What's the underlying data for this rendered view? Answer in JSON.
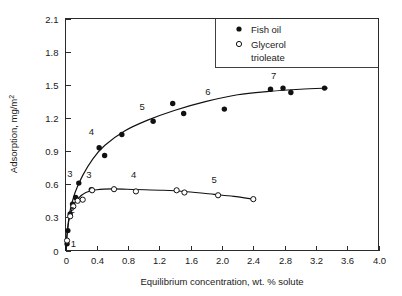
{
  "chart_data": {
    "type": "scatter",
    "title": "",
    "xlabel": "Equilibrium concentration, wt. % solute",
    "ylabel": "Adsorption, mg/m2",
    "ylabel_display": "Adsorption, mg/m",
    "ylabel_exponent": "2",
    "xlim": [
      0,
      4.0
    ],
    "ylim": [
      0,
      2.1
    ],
    "xticks": [
      "0",
      "0.4",
      "0.8",
      "1.2",
      "1.6",
      "2.0",
      "2.4",
      "2.8",
      "3.2",
      "3.6",
      "4.0"
    ],
    "xtick_values": [
      0,
      0.4,
      0.8,
      1.2,
      1.6,
      2.0,
      2.4,
      2.8,
      3.2,
      3.6,
      4.0
    ],
    "yticks": [
      "0",
      "0.3",
      "0.6",
      "0.9",
      "1.2",
      "1.5",
      "1.8",
      "2.1"
    ],
    "ytick_values": [
      0,
      0.3,
      0.6,
      0.9,
      1.2,
      1.5,
      1.8,
      2.1
    ],
    "grid": false,
    "legend_position": "top-right",
    "series": [
      {
        "name": "Fish oil",
        "marker": "filled-circle",
        "color": "#111111",
        "points": [
          {
            "x": 0.02,
            "y": 0.06
          },
          {
            "x": 0.03,
            "y": 0.18
          },
          {
            "x": 0.06,
            "y": 0.33
          },
          {
            "x": 0.09,
            "y": 0.42
          },
          {
            "x": 0.13,
            "y": 0.48
          },
          {
            "x": 0.17,
            "y": 0.61
          },
          {
            "x": 0.33,
            "y": 0.55
          },
          {
            "x": 0.43,
            "y": 0.93
          },
          {
            "x": 0.5,
            "y": 0.86
          },
          {
            "x": 0.72,
            "y": 1.05
          },
          {
            "x": 1.12,
            "y": 1.17
          },
          {
            "x": 1.37,
            "y": 1.33
          },
          {
            "x": 1.51,
            "y": 1.24
          },
          {
            "x": 2.03,
            "y": 1.28
          },
          {
            "x": 2.62,
            "y": 1.46
          },
          {
            "x": 2.78,
            "y": 1.47
          },
          {
            "x": 2.88,
            "y": 1.43
          },
          {
            "x": 3.31,
            "y": 1.47
          }
        ],
        "curve": [
          {
            "x": 0.0,
            "y": 0.0
          },
          {
            "x": 0.05,
            "y": 0.33
          },
          {
            "x": 0.12,
            "y": 0.52
          },
          {
            "x": 0.22,
            "y": 0.68
          },
          {
            "x": 0.35,
            "y": 0.83
          },
          {
            "x": 0.5,
            "y": 0.95
          },
          {
            "x": 0.75,
            "y": 1.08
          },
          {
            "x": 1.05,
            "y": 1.18
          },
          {
            "x": 1.4,
            "y": 1.27
          },
          {
            "x": 1.8,
            "y": 1.35
          },
          {
            "x": 2.2,
            "y": 1.41
          },
          {
            "x": 2.6,
            "y": 1.44
          },
          {
            "x": 3.0,
            "y": 1.46
          },
          {
            "x": 3.35,
            "y": 1.47
          }
        ],
        "point_labels": [
          {
            "text": "1",
            "x": 0.1,
            "y": 0.035
          },
          {
            "text": "2",
            "x": 0.085,
            "y": 0.335
          },
          {
            "text": "3",
            "x": 0.055,
            "y": 0.665
          },
          {
            "text": "4",
            "x": 0.33,
            "y": 1.045
          },
          {
            "text": "5",
            "x": 0.98,
            "y": 1.275
          },
          {
            "text": "6",
            "x": 1.82,
            "y": 1.405
          },
          {
            "text": "7",
            "x": 2.66,
            "y": 1.555
          }
        ]
      },
      {
        "name": "Glycerol trioleate",
        "marker": "open-circle",
        "color": "#111111",
        "points": [
          {
            "x": 0.02,
            "y": 0.09
          },
          {
            "x": 0.06,
            "y": 0.31
          },
          {
            "x": 0.1,
            "y": 0.4
          },
          {
            "x": 0.155,
            "y": 0.45
          },
          {
            "x": 0.22,
            "y": 0.46
          },
          {
            "x": 0.34,
            "y": 0.545
          },
          {
            "x": 0.62,
            "y": 0.555
          },
          {
            "x": 0.9,
            "y": 0.535
          },
          {
            "x": 1.42,
            "y": 0.545
          },
          {
            "x": 1.52,
            "y": 0.525
          },
          {
            "x": 1.95,
            "y": 0.5
          },
          {
            "x": 2.4,
            "y": 0.465
          }
        ],
        "curve": [
          {
            "x": 0.0,
            "y": 0.0
          },
          {
            "x": 0.04,
            "y": 0.26
          },
          {
            "x": 0.09,
            "y": 0.39
          },
          {
            "x": 0.16,
            "y": 0.47
          },
          {
            "x": 0.26,
            "y": 0.525
          },
          {
            "x": 0.4,
            "y": 0.55
          },
          {
            "x": 0.6,
            "y": 0.558
          },
          {
            "x": 0.9,
            "y": 0.552
          },
          {
            "x": 1.25,
            "y": 0.545
          },
          {
            "x": 1.55,
            "y": 0.532
          },
          {
            "x": 1.9,
            "y": 0.508
          },
          {
            "x": 2.15,
            "y": 0.49
          },
          {
            "x": 2.4,
            "y": 0.465
          }
        ],
        "point_labels": [
          {
            "text": "3",
            "x": 0.3,
            "y": 0.655
          },
          {
            "text": "4",
            "x": 0.87,
            "y": 0.655
          },
          {
            "text": "5",
            "x": 1.9,
            "y": 0.615
          }
        ]
      }
    ],
    "legend": [
      {
        "label": "Fish oil",
        "marker": "filled-circle"
      },
      {
        "label": "Glycerol",
        "label2": "trioleate",
        "marker": "open-circle"
      }
    ]
  },
  "legend": {
    "fish_oil": "Fish oil",
    "glycerol_line1": "Glycerol",
    "glycerol_line2": "trioleate"
  },
  "axes": {
    "x_title": "Equilibrium concentration, wt. % solute",
    "y_title": "Adsorption, mg/m",
    "y_title_sup": "2"
  }
}
